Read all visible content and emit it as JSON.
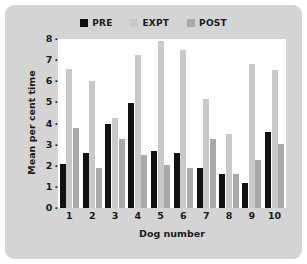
{
  "chart_data": {
    "type": "bar",
    "title": "",
    "xlabel": "Dog number",
    "ylabel": "Mean per cent time",
    "categories": [
      "1",
      "2",
      "3",
      "4",
      "5",
      "6",
      "7",
      "8",
      "9",
      "10"
    ],
    "ylim": [
      0,
      8
    ],
    "yticks": [
      "0",
      "1",
      "2",
      "3",
      "4",
      "5",
      "6",
      "7",
      "8"
    ],
    "tick_dot": "·",
    "grid": false,
    "legend_position": "top-center",
    "series": [
      {
        "name": "PRE",
        "color": "#111111",
        "values": [
          2.1,
          2.6,
          4.0,
          4.95,
          2.7,
          2.6,
          1.9,
          1.6,
          1.2,
          3.6
        ]
      },
      {
        "name": "EXPT",
        "color": "#c9c9c9",
        "values": [
          6.6,
          6.0,
          4.25,
          7.25,
          7.9,
          7.5,
          5.15,
          3.5,
          6.8,
          6.55
        ]
      },
      {
        "name": "POST",
        "color": "#a9a9a9",
        "values": [
          3.8,
          1.9,
          3.25,
          2.5,
          2.05,
          1.9,
          3.25,
          1.6,
          2.25,
          3.05
        ]
      }
    ]
  },
  "figure": {
    "panel_color": "#d4d4d4",
    "plot_background": "#ffffff"
  }
}
